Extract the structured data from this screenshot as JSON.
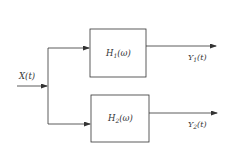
{
  "diagram": {
    "type": "block-diagram",
    "input": {
      "label": "X(t)",
      "base": "X",
      "arg": "(t)"
    },
    "blocks": [
      {
        "id": "h1",
        "label": "H1(ω)",
        "base": "H",
        "sub": "1",
        "arg": "(ω)"
      },
      {
        "id": "h2",
        "label": "H2(ω)",
        "base": "H",
        "sub": "2",
        "arg": "(ω)"
      }
    ],
    "outputs": [
      {
        "id": "y1",
        "label": "Y1(t)",
        "base": "Y",
        "sub": "1",
        "arg": "(t)"
      },
      {
        "id": "y2",
        "label": "Y2(t)",
        "base": "Y",
        "sub": "2",
        "arg": "(t)"
      }
    ],
    "edges": [
      {
        "from": "input",
        "to": "h1"
      },
      {
        "from": "input",
        "to": "h2"
      },
      {
        "from": "h1",
        "to": "y1"
      },
      {
        "from": "h2",
        "to": "y2"
      }
    ],
    "colors": {
      "line": "#333333",
      "background": "#ffffff"
    }
  }
}
